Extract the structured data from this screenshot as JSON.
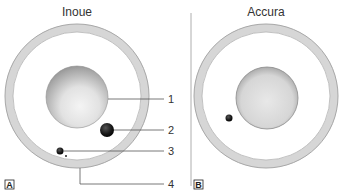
{
  "figure": {
    "panels": [
      {
        "id": "A",
        "title": "Inoue",
        "letter": "A",
        "callouts": [
          {
            "number": "1",
            "target": "nucleus / inner sphere"
          },
          {
            "number": "2",
            "target": "large dark particle"
          },
          {
            "number": "3",
            "target": "small dark particle"
          },
          {
            "number": "4",
            "target": "outer ring"
          }
        ]
      },
      {
        "id": "B",
        "title": "Accura",
        "letter": "B"
      }
    ],
    "colors": {
      "ring_fill": "#d8d8d8",
      "ring_edge": "#a8a8a8",
      "sphere_light": "#f0f0f0",
      "sphere_dark": "#8a8a8a",
      "particle": "#111111",
      "line": "#555555",
      "divider": "#999999"
    }
  }
}
